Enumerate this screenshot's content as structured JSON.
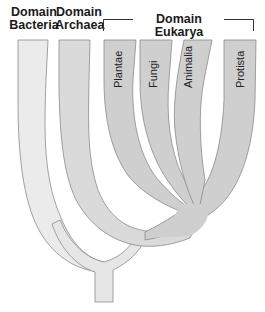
{
  "diagram": {
    "type": "phylogenetic-tree",
    "headers": {
      "bacteria": [
        "Domain",
        "Bacteria"
      ],
      "archaea": [
        "Domain",
        "Archaea"
      ],
      "eukarya": "Domain Eukarya"
    },
    "kingdoms": [
      {
        "label": "Plantae"
      },
      {
        "label": "Fungi"
      },
      {
        "label": "Animalia"
      },
      {
        "label": "Protista"
      }
    ],
    "colors": {
      "bacteria_fill": "#ebebeb",
      "archaea_fill": "#d9d9d9",
      "eukarya_fill": "#cfcfcf",
      "outline": "#8a8a8a",
      "text": "#1a1a1a"
    }
  }
}
